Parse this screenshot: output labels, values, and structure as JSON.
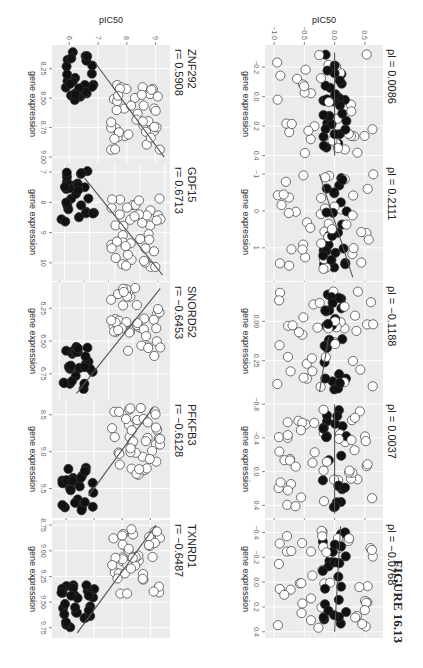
{
  "figure": {
    "caption": "FIGURE 16.13",
    "orientation": "rotated 90 degrees (landscape figure printed sideways)"
  },
  "chart_data": [
    {
      "type": "scatter",
      "panel": "top-1",
      "title": "TXNRD1",
      "stat_label": "r= −0.6487",
      "xlabel": "gene expression",
      "ylabel": "pIC50",
      "xticks": [
        "8.75",
        "9.00",
        "9.25",
        "9.50",
        "9.75"
      ],
      "yticks": [
        "9",
        "8",
        "7",
        "6"
      ],
      "xlim": [
        8.7,
        9.85
      ],
      "ylim": [
        5.5,
        9.7
      ],
      "fit_line": {
        "x": [
          8.75,
          9.8
        ],
        "y": [
          9.2,
          6.4
        ]
      },
      "groups": [
        {
          "name": "sensitive",
          "fill": "#ffffff"
        },
        {
          "name": "resistant",
          "fill": "#111111"
        }
      ]
    },
    {
      "type": "scatter",
      "panel": "top-2",
      "title": "PFKFB3",
      "stat_label": "r= −0.6128",
      "xlabel": "gene expression",
      "ylabel": "pIC50",
      "xticks": [
        "8.5",
        "9.0",
        "9.5"
      ],
      "yticks": [
        "9",
        "8",
        "7",
        "6"
      ],
      "xlim": [
        8.3,
        9.9
      ],
      "ylim": [
        5.5,
        9.7
      ],
      "fit_line": {
        "x": [
          8.4,
          9.6
        ],
        "y": [
          9.1,
          6.8
        ]
      },
      "groups": [
        {
          "name": "sensitive",
          "fill": "#ffffff"
        },
        {
          "name": "resistant",
          "fill": "#111111"
        }
      ]
    },
    {
      "type": "scatter",
      "panel": "top-3",
      "title": "SNORD52",
      "stat_label": "r= −0.6453",
      "xlabel": "gene expression",
      "ylabel": "pIC50",
      "xticks": [
        "6.25",
        "6.50",
        "6.75"
      ],
      "yticks": [
        "9",
        "8",
        "7",
        "6",
        "5"
      ],
      "xlim": [
        6.05,
        6.95
      ],
      "ylim": [
        4.7,
        9.5
      ],
      "fit_line": {
        "x": [
          6.1,
          6.9
        ],
        "y": [
          9.1,
          5.7
        ]
      },
      "groups": [
        {
          "name": "sensitive",
          "fill": "#ffffff"
        },
        {
          "name": "resistant",
          "fill": "#111111"
        }
      ]
    },
    {
      "type": "scatter",
      "panel": "top-4",
      "title": "GDF15",
      "stat_label": "r= 0.6713",
      "xlabel": "gene expression",
      "ylabel": "pIC50",
      "xticks": [
        "7",
        "8",
        "9",
        "10"
      ],
      "yticks": [
        "10",
        "9",
        "8",
        "7",
        "6"
      ],
      "xlim": [
        6.7,
        10.6
      ],
      "ylim": [
        5.5,
        10.2
      ],
      "fit_line": {
        "x": [
          7.2,
          10.4
        ],
        "y": [
          6.8,
          9.9
        ]
      },
      "groups": [
        {
          "name": "sensitive",
          "fill": "#ffffff"
        },
        {
          "name": "resistant",
          "fill": "#111111"
        }
      ]
    },
    {
      "type": "scatter",
      "panel": "top-5",
      "title": "ZNF292",
      "stat_label": "r= 0.5908",
      "xlabel": "gene expression",
      "ylabel": "pIC50",
      "xticks": [
        "8.25",
        "8.50",
        "8.75",
        "9.00"
      ],
      "yticks": [
        "9",
        "8",
        "7",
        "6"
      ],
      "xlim": [
        8.05,
        9.05
      ],
      "ylim": [
        5.4,
        9.5
      ],
      "fit_line": {
        "x": [
          8.2,
          9.0
        ],
        "y": [
          6.9,
          9.3
        ]
      },
      "groups": [
        {
          "name": "sensitive",
          "fill": "#ffffff"
        },
        {
          "name": "resistant",
          "fill": "#111111"
        }
      ]
    },
    {
      "type": "scatter",
      "panel": "bottom-1",
      "title": "",
      "stat_label": "ρl = −0.0768",
      "xlabel": "gene expression",
      "ylabel": "pIC50",
      "xticks": [
        "−0.4",
        "−0.2",
        "0.0",
        "0.2",
        "0.4"
      ],
      "yticks": [
        "0.5",
        "0.0",
        "−0.5",
        "−1.0"
      ],
      "xlim": [
        -0.5,
        0.45
      ],
      "ylim": [
        -1.15,
        0.8
      ],
      "fit_line": {
        "x": [
          -0.45,
          0.4
        ],
        "y": [
          0.1,
          0.0
        ]
      }
    },
    {
      "type": "scatter",
      "panel": "bottom-2",
      "title": "",
      "stat_label": "ρl = 0.0037",
      "xlabel": "gene expression",
      "ylabel": "pIC50",
      "xticks": [
        "−0.8",
        "−0.4",
        "0.0",
        "0.4"
      ],
      "yticks": [
        "0.5",
        "0.0",
        "−0.5",
        "−1.0"
      ],
      "xlim": [
        -0.85,
        0.55
      ],
      "ylim": [
        -1.15,
        0.8
      ],
      "fit_line": {
        "x": [
          -0.8,
          0.5
        ],
        "y": [
          0.0,
          0.0
        ]
      }
    },
    {
      "type": "scatter",
      "panel": "bottom-3",
      "title": "",
      "stat_label": "ρl = −0.1188",
      "xlabel": "gene expression",
      "ylabel": "pIC50",
      "xticks": [
        "0.00",
        "0.25"
      ],
      "yticks": [
        "0.5",
        "0.0",
        "−0.5",
        "−1.0"
      ],
      "xlim": [
        -0.25,
        0.5
      ],
      "ylim": [
        -1.15,
        0.8
      ],
      "fit_line": {
        "x": [
          0.1,
          0.45
        ],
        "y": [
          -0.1,
          -0.25
        ]
      }
    },
    {
      "type": "scatter",
      "panel": "bottom-4",
      "title": "",
      "stat_label": "ρl = 0.2111",
      "xlabel": "gene expression",
      "ylabel": "pIC50",
      "xticks": [
        "−1",
        "0",
        "1"
      ],
      "yticks": [
        "0.5",
        "0.0",
        "−0.5",
        "−1.0"
      ],
      "xlim": [
        -1.3,
        1.9
      ],
      "ylim": [
        -1.15,
        0.8
      ],
      "fit_line": {
        "x": [
          -1.0,
          1.8
        ],
        "y": [
          -0.25,
          0.3
        ]
      }
    },
    {
      "type": "scatter",
      "panel": "bottom-5",
      "title": "",
      "stat_label": "ρl = 0.0086",
      "xlabel": "gene expression",
      "ylabel": "pIC50",
      "xticks": [
        "−0.2",
        "0.0",
        "0.2",
        "0.4"
      ],
      "yticks": [
        "0.5",
        "0.0",
        "−0.5",
        "−1.0"
      ],
      "xlim": [
        -0.35,
        0.45
      ],
      "ylim": [
        -1.15,
        0.8
      ],
      "fit_line": {
        "x": [
          -0.3,
          0.4
        ],
        "y": [
          0.0,
          0.0
        ]
      }
    }
  ],
  "panels": {
    "top": [
      {
        "title": "TXNRD1",
        "stat": "r= −0.6487",
        "xlabel": "gene expression",
        "ylabel": "pIC50",
        "xticks": [
          "8.75",
          "9.00",
          "9.25",
          "9.50",
          "9.75"
        ],
        "yticks": [
          "9",
          "8",
          "7",
          "6"
        ]
      },
      {
        "title": "PFKFB3",
        "stat": "r= −0.6128",
        "xlabel": "gene expression",
        "ylabel": "pIC50",
        "xticks": [
          "8.5",
          "9.0",
          "9.5"
        ],
        "yticks": [
          "9",
          "8",
          "7",
          "6"
        ]
      },
      {
        "title": "SNORD52",
        "stat": "r= −0.6453",
        "xlabel": "gene expression",
        "ylabel": "pIC50",
        "xticks": [
          "6.25",
          "6.50",
          "6.75"
        ],
        "yticks": [
          "9",
          "8",
          "7",
          "6",
          "5"
        ]
      },
      {
        "title": "GDF15",
        "stat": "r= 0.6713",
        "xlabel": "gene expression",
        "ylabel": "pIC50",
        "xticks": [
          "7",
          "8",
          "9",
          "10"
        ],
        "yticks": [
          "10",
          "9",
          "8",
          "7",
          "6"
        ]
      },
      {
        "title": "ZNF292",
        "stat": "r= 0.5908",
        "xlabel": "gene expression",
        "ylabel": "pIC50",
        "xticks": [
          "8.25",
          "8.50",
          "8.75",
          "9.00"
        ],
        "yticks": [
          "9",
          "8",
          "7",
          "6"
        ]
      }
    ],
    "bottom": [
      {
        "stat": "ρl = −0.0768",
        "xlabel": "gene expression",
        "ylabel": "pIC50",
        "xticks": [
          "−0.4",
          "−0.2",
          "0.0",
          "0.2",
          "0.4"
        ],
        "yticks": [
          "0.5",
          "0.0",
          "−0.5",
          "−1.0"
        ]
      },
      {
        "stat": "ρl = 0.0037",
        "xlabel": "gene expression",
        "ylabel": "pIC50",
        "xticks": [
          "−0.8",
          "−0.4",
          "0.0",
          "0.4"
        ],
        "yticks": [
          "0.5",
          "0.0",
          "−0.5",
          "−1.0"
        ]
      },
      {
        "stat": "ρl = −0.1188",
        "xlabel": "gene expression",
        "ylabel": "pIC50",
        "xticks": [
          "0.00",
          "0.25"
        ],
        "yticks": [
          "0.5",
          "0.0",
          "−0.5",
          "−1.0"
        ]
      },
      {
        "stat": "ρl = 0.2111",
        "xlabel": "gene expression",
        "ylabel": "pIC50",
        "xticks": [
          "−1",
          "0",
          "1"
        ],
        "yticks": [
          "0.5",
          "0.0",
          "−0.5",
          "−1.0"
        ]
      },
      {
        "stat": "ρl = 0.0086",
        "xlabel": "gene expression",
        "ylabel": "pIC50",
        "xticks": [
          "−0.2",
          "0.0",
          "0.2",
          "0.4"
        ],
        "yticks": [
          "0.5",
          "0.0",
          "−0.5",
          "−1.0"
        ]
      }
    ]
  },
  "colors": {
    "panel_bg": "#ebebeb",
    "grid": "#ffffff",
    "point_open": "#ffffff",
    "point_filled": "#111111",
    "point_stroke": "#333333",
    "fit_line": "#555555",
    "text": "#222222",
    "tick_text": "#666666"
  }
}
